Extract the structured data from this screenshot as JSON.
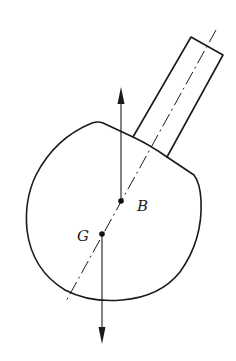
{
  "diagram": {
    "labels": {
      "buoyancy_center": "B",
      "gravity_center": "G"
    },
    "forces": [
      {
        "name": "buoyancy-force",
        "direction": "up",
        "origin": "B"
      },
      {
        "name": "weight-force",
        "direction": "down",
        "origin": "G"
      }
    ],
    "colors": {
      "stroke": "#1a1a1a",
      "background": "#ffffff"
    }
  }
}
